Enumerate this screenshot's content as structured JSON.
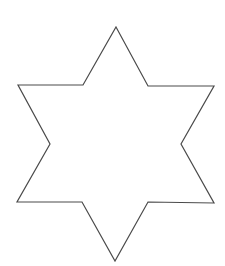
{
  "figure": {
    "shape": "six-pointed-star",
    "fill_color": "#ffffff",
    "stroke_color": "#4a4a4a",
    "background_color": "#ffffff",
    "points": "116,27 148,86 214,86 181,144 214,203 148,202 115,261 82,202 17,202 50,144 18,85 83,85"
  }
}
